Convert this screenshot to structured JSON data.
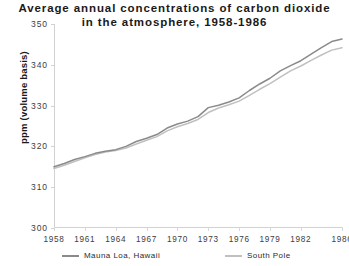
{
  "chart_data": {
    "type": "line",
    "title": "Average annual concentrations of carbon dioxide in the atmosphere, 1958-1986",
    "title_lines": [
      "Average annual concentrations of carbon dioxide",
      "in the atmosphere, 1958-1986"
    ],
    "xlabel": "",
    "ylabel": "ppm (volume basis)",
    "ylim": [
      300,
      350
    ],
    "yticks": [
      300,
      310,
      320,
      330,
      340,
      350
    ],
    "ytick_labels": [
      "300",
      "310",
      "320",
      "330",
      "340",
      "350"
    ],
    "xlim": [
      1958,
      1986
    ],
    "xticks": [
      1958,
      1961,
      1964,
      1967,
      1970,
      1973,
      1976,
      1979,
      1982,
      1986
    ],
    "xtick_labels": [
      "1958",
      "1961",
      "1964",
      "1967",
      "1970",
      "1973",
      "1976",
      "1979",
      "1982",
      "1986"
    ],
    "grid": false,
    "legend_position": "below-axes",
    "x": [
      1958,
      1959,
      1960,
      1961,
      1962,
      1963,
      1964,
      1965,
      1966,
      1967,
      1968,
      1969,
      1970,
      1971,
      1972,
      1973,
      1974,
      1975,
      1976,
      1977,
      1978,
      1979,
      1980,
      1981,
      1982,
      1983,
      1984,
      1985,
      1986
    ],
    "series": [
      {
        "name": "Mauna Loa, Hawaii",
        "color": "#8a8a8a",
        "values": [
          315.0,
          315.8,
          316.8,
          317.5,
          318.3,
          318.8,
          319.2,
          320.0,
          321.2,
          322.0,
          322.9,
          324.5,
          325.5,
          326.2,
          327.3,
          329.5,
          330.1,
          330.9,
          331.9,
          333.7,
          335.3,
          336.7,
          338.5,
          339.8,
          341.0,
          342.6,
          344.2,
          345.7,
          346.3
        ]
      },
      {
        "name": "South Pole",
        "color": "#c0c0c0",
        "values": [
          314.6,
          315.4,
          316.3,
          317.2,
          318.0,
          318.6,
          319.0,
          319.6,
          320.6,
          321.5,
          322.4,
          323.8,
          324.8,
          325.6,
          326.6,
          328.3,
          329.4,
          330.2,
          331.1,
          332.5,
          334.0,
          335.4,
          337.0,
          338.5,
          339.7,
          341.1,
          342.4,
          343.6,
          344.2
        ]
      }
    ]
  },
  "legend": {
    "entries": [
      {
        "label": "Mauna Loa, Hawaii",
        "color": "#8a8a8a"
      },
      {
        "label": "South Pole",
        "color": "#c0c0c0"
      }
    ]
  },
  "colors": {
    "axis": "#d2d2d2",
    "text": "#2b2b2b",
    "background": "#ffffff"
  }
}
